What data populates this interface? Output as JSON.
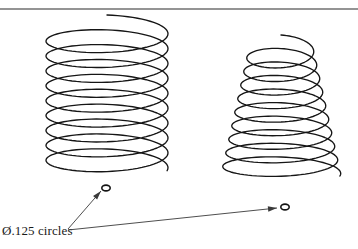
{
  "figure": {
    "background_color": "#ffffff",
    "line_color": "#151515",
    "leader_color": "#3a3a3a",
    "width": 358,
    "height": 249
  },
  "top_rule": {
    "name": "horizontal-divider",
    "y": 9,
    "x_start": 0,
    "x_end": 358,
    "color": "#2b2b2b"
  },
  "annotations": {
    "callout_label": "Ø.125 circles",
    "diameter_value": ".125",
    "diameter_symbol": "Ø",
    "subject": "circles",
    "text_x": 2,
    "text_y": 224
  },
  "leaders": [
    {
      "name": "leader-to-left-circle",
      "from_x": 68,
      "from_y": 229,
      "to_x": 101,
      "to_y": 191,
      "arrow": "at-end"
    },
    {
      "name": "leader-to-right-circle",
      "from_x": 68,
      "from_y": 230,
      "to_x": 277,
      "to_y": 208,
      "arrow": "at-end"
    }
  ],
  "reference_circles": [
    {
      "name": "wire-section-left",
      "cx": 106,
      "cy": 188,
      "rx": 4.2,
      "ry": 2.9
    },
    {
      "name": "wire-section-right",
      "cx": 285,
      "cy": 207,
      "rx": 4.2,
      "ry": 2.9
    }
  ],
  "coils": [
    {
      "name": "cylindrical-coil",
      "shape": "cylindrical",
      "turns": 9,
      "center_x": 107,
      "top_y": 30,
      "bottom_y": 164,
      "top_rx": 61,
      "bottom_rx": 61,
      "ry": 15,
      "tail_length": 18
    },
    {
      "name": "conical-coil",
      "shape": "conical",
      "turns": 9,
      "center_x": 281,
      "top_y": 48,
      "bottom_y": 170,
      "top_rx": 32,
      "bottom_rx": 59,
      "ry": 13,
      "tail_length": 18
    }
  ]
}
